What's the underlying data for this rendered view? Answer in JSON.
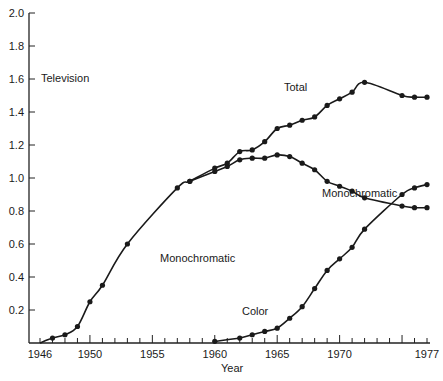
{
  "chart_data": {
    "type": "line",
    "title": "Television",
    "xlabel": "Year",
    "ylabel": "",
    "xlim": [
      1946,
      1977
    ],
    "ylim": [
      0,
      2.0
    ],
    "x_ticks": [
      "1946",
      "1950",
      "1955",
      "1960",
      "1965",
      "1970",
      "1977"
    ],
    "y_ticks": [
      "0.2",
      "0.4",
      "0.6",
      "0.8",
      "1.0",
      "1.2",
      "1.4",
      "1.6",
      "1.8",
      "2.0"
    ],
    "grid": false,
    "annotations": [
      "Television",
      "Total",
      "Monochromatic",
      "Monochromatic",
      "Color"
    ],
    "series": [
      {
        "name": "Total",
        "x": [
          1947,
          1948,
          1949,
          1950,
          1951,
          1953,
          1957,
          1958,
          1960,
          1961,
          1962,
          1963,
          1964,
          1965,
          1966,
          1967,
          1968,
          1969,
          1970,
          1971,
          1972,
          1975,
          1976,
          1977
        ],
        "values": [
          0.03,
          0.05,
          0.1,
          0.25,
          0.35,
          0.6,
          0.94,
          0.98,
          1.06,
          1.09,
          1.16,
          1.17,
          1.22,
          1.3,
          1.32,
          1.35,
          1.37,
          1.44,
          1.48,
          1.52,
          1.58,
          1.5,
          1.49,
          1.49
        ]
      },
      {
        "name": "Monochromatic",
        "x": [
          1958,
          1960,
          1961,
          1962,
          1963,
          1964,
          1965,
          1966,
          1967,
          1968,
          1969,
          1970,
          1971,
          1972,
          1975,
          1976,
          1977
        ],
        "values": [
          0.98,
          1.04,
          1.07,
          1.11,
          1.12,
          1.12,
          1.14,
          1.13,
          1.09,
          1.05,
          0.98,
          0.95,
          0.92,
          0.88,
          0.83,
          0.82,
          0.82
        ]
      },
      {
        "name": "Color",
        "x": [
          1960,
          1962,
          1963,
          1964,
          1965,
          1966,
          1967,
          1968,
          1969,
          1970,
          1971,
          1972,
          1975,
          1976,
          1977
        ],
        "values": [
          0.01,
          0.03,
          0.05,
          0.07,
          0.09,
          0.15,
          0.22,
          0.33,
          0.44,
          0.51,
          0.58,
          0.69,
          0.9,
          0.94,
          0.96
        ]
      }
    ]
  },
  "labels": {
    "title": "Television",
    "total": "Total",
    "mono_upper": "Monochromatic",
    "mono_lower": "Monochromatic",
    "color": "Color",
    "xlabel": "Year"
  }
}
